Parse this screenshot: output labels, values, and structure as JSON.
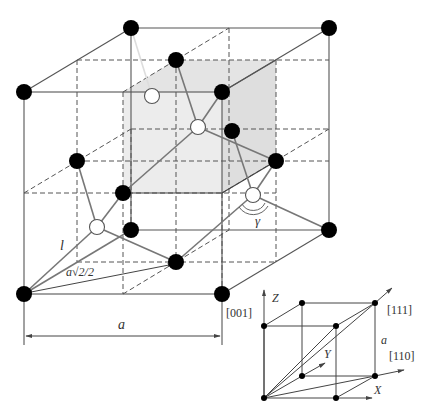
{
  "figure": {
    "colors": {
      "lattice_line": "#555555",
      "dashed_line": "#555555",
      "bond_line": "#777777",
      "shaded_subcube": "#e6e6e6",
      "atom_filled": "#000000",
      "atom_open": "#ffffff"
    }
  },
  "main_cell": {
    "labels": {
      "bond_length": "l",
      "half_face_diagonal": "a√2/2",
      "angle": "γ",
      "lattice_constant": "a",
      "direction_001": "[001]"
    }
  },
  "inset_cell": {
    "labels": {
      "z_axis": "Z",
      "y_axis": "Y",
      "x_axis": "X",
      "direction_111": "[111]",
      "direction_110": "[110]",
      "edge": "a"
    }
  }
}
